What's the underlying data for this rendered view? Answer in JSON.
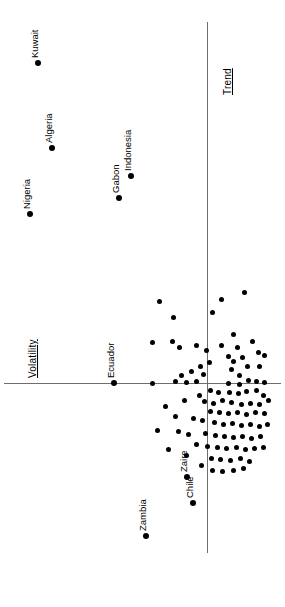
{
  "figure": {
    "orientation": "rotated-90",
    "background_color": "#ffffff",
    "point_color": "#000000",
    "axis_color": "#6e6e6e"
  },
  "axes": {
    "horizontal_label": "Trend",
    "vertical_label": "Volatility"
  },
  "chart_data": {
    "type": "scatter",
    "title": "",
    "xlabel": "Trend",
    "ylabel": "Volatility",
    "grid": false,
    "legend": null,
    "note": "Pixel coordinates in the 285x607 rendered (rotated 90 degrees) image. Origin of the drawn axes is at px=(207,383).",
    "axis_origin_px": [
      207,
      383
    ],
    "horizontal_axis_px": {
      "y": 383,
      "x_start": 4,
      "x_end": 281
    },
    "vertical_axis_px": {
      "x": 207,
      "y_start": 22,
      "y_end": 553
    },
    "labeled_points": [
      {
        "label": "Kuwait",
        "px": [
          38,
          63
        ],
        "label_px": [
          30,
          58
        ]
      },
      {
        "label": "Algeria",
        "px": [
          52,
          148
        ],
        "label_px": [
          44,
          143
        ]
      },
      {
        "label": "Nigeria",
        "px": [
          30,
          214
        ],
        "label_px": [
          22,
          209
        ]
      },
      {
        "label": "Indonesia",
        "px": [
          131,
          176
        ],
        "label_px": [
          123,
          171
        ]
      },
      {
        "label": "Gabon",
        "px": [
          119,
          198
        ],
        "label_px": [
          111,
          193
        ]
      },
      {
        "label": "Ecuador",
        "px": [
          114,
          383
        ],
        "label_px": [
          106,
          378
        ]
      },
      {
        "label": "Zambia",
        "px": [
          146,
          536
        ],
        "label_px": [
          138,
          531
        ]
      },
      {
        "label": "Zaire",
        "px": [
          187,
          477
        ],
        "label_px": [
          179,
          472
        ]
      },
      {
        "label": "Chile",
        "px": [
          193,
          503
        ],
        "label_px": [
          185,
          498
        ]
      }
    ],
    "unlabeled_points_px": [
      [
        159,
        301
      ],
      [
        221,
        299
      ],
      [
        244,
        292
      ],
      [
        173,
        317
      ],
      [
        212,
        312
      ],
      [
        152,
        342
      ],
      [
        172,
        341
      ],
      [
        179,
        347
      ],
      [
        196,
        345
      ],
      [
        206,
        350
      ],
      [
        221,
        345
      ],
      [
        233,
        334
      ],
      [
        237,
        347
      ],
      [
        228,
        356
      ],
      [
        242,
        357
      ],
      [
        252,
        341
      ],
      [
        258,
        352
      ],
      [
        247,
        366
      ],
      [
        259,
        366
      ],
      [
        264,
        355
      ],
      [
        200,
        366
      ],
      [
        209,
        362
      ],
      [
        191,
        371
      ],
      [
        181,
        375
      ],
      [
        203,
        374
      ],
      [
        231,
        369
      ],
      [
        239,
        375
      ],
      [
        233,
        361
      ],
      [
        152,
        383
      ],
      [
        175,
        381
      ],
      [
        186,
        382
      ],
      [
        196,
        381
      ],
      [
        228,
        383
      ],
      [
        239,
        384
      ],
      [
        248,
        380
      ],
      [
        256,
        381
      ],
      [
        264,
        382
      ],
      [
        210,
        390
      ],
      [
        218,
        392
      ],
      [
        199,
        395
      ],
      [
        229,
        392
      ],
      [
        238,
        393
      ],
      [
        246,
        391
      ],
      [
        256,
        390
      ],
      [
        263,
        395
      ],
      [
        184,
        400
      ],
      [
        204,
        401
      ],
      [
        213,
        403
      ],
      [
        222,
        400
      ],
      [
        231,
        402
      ],
      [
        241,
        404
      ],
      [
        250,
        403
      ],
      [
        259,
        404
      ],
      [
        268,
        400
      ],
      [
        210,
        411
      ],
      [
        219,
        412
      ],
      [
        228,
        413
      ],
      [
        237,
        412
      ],
      [
        246,
        414
      ],
      [
        255,
        412
      ],
      [
        264,
        413
      ],
      [
        165,
        406
      ],
      [
        175,
        416
      ],
      [
        193,
        418
      ],
      [
        202,
        420
      ],
      [
        214,
        422
      ],
      [
        223,
        424
      ],
      [
        232,
        423
      ],
      [
        241,
        425
      ],
      [
        250,
        424
      ],
      [
        259,
        426
      ],
      [
        267,
        424
      ],
      [
        157,
        430
      ],
      [
        178,
        431
      ],
      [
        188,
        434
      ],
      [
        205,
        433
      ],
      [
        215,
        435
      ],
      [
        224,
        436
      ],
      [
        233,
        437
      ],
      [
        242,
        436
      ],
      [
        251,
        438
      ],
      [
        260,
        436
      ],
      [
        196,
        444
      ],
      [
        207,
        446
      ],
      [
        217,
        447
      ],
      [
        226,
        448
      ],
      [
        236,
        447
      ],
      [
        245,
        449
      ],
      [
        254,
        448
      ],
      [
        263,
        447
      ],
      [
        168,
        449
      ],
      [
        186,
        455
      ],
      [
        211,
        458
      ],
      [
        220,
        459
      ],
      [
        230,
        460
      ],
      [
        240,
        458
      ],
      [
        249,
        461
      ],
      [
        212,
        470
      ],
      [
        222,
        471
      ],
      [
        233,
        470
      ],
      [
        201,
        465
      ],
      [
        243,
        468
      ]
    ]
  }
}
